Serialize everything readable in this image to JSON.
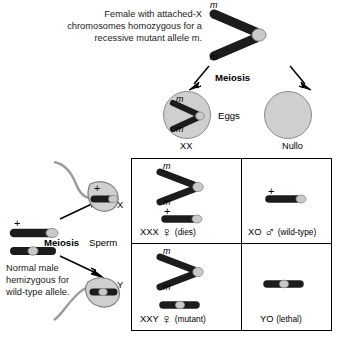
{
  "figure": {
    "title_female": "Female with attached-X chromosomes homozygous for a recessive mutant allele m.",
    "title_male": "Normal male hemizygous for wild-type allele."
  },
  "labels": {
    "meiosis_top": "Meiosis",
    "meiosis_bottom": "Meiosis",
    "sperm": "Sperm",
    "eggs": "Eggs",
    "egg_xx": "XX",
    "egg_nullo": "Nullo",
    "sperm_x": "X",
    "sperm_y": "Y",
    "allele_mutant": "m",
    "allele_wildtype": "+"
  },
  "punnett": {
    "cells": [
      {
        "genotype": "XXX",
        "symbol": "♀",
        "note": "(dies)",
        "contents": "attached-X with m alleles plus X chromosome with + allele"
      },
      {
        "genotype": "XO",
        "symbol": "♂",
        "note": "(wild-type)",
        "contents": "X chromosome with + allele"
      },
      {
        "genotype": "XXY",
        "symbol": "♀",
        "note": "(mutant)",
        "contents": "attached-X with m alleles plus Y chromosome"
      },
      {
        "genotype": "YO",
        "symbol": "",
        "note": "(lethal)",
        "contents": "Y chromosome only"
      }
    ]
  },
  "colors": {
    "chromosome_arm": "#1c1c1c",
    "centromere": "#c9c9c9",
    "cell_fill": "#cfcfcf",
    "cell_outline": "#8a8a8a",
    "text": "#000000",
    "background": "#ffffff"
  }
}
